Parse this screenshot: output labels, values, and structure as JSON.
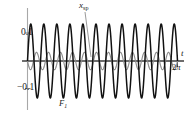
{
  "figure": {
    "labels": {
      "y_tick_positive": "0.1",
      "y_tick_negative": "−0.1",
      "curve_small_base": "x",
      "curve_small_sub": "sp",
      "curve_large_base": "F",
      "curve_large_sub": "1",
      "x_axis_name": "t",
      "x_tick_right_value": "2",
      "x_tick_right_unit": "π"
    },
    "colors": {
      "curve_large": "#111111",
      "curve_small": "#8a8a8a",
      "axis": "#9a9a9a",
      "x_axis": "#555555",
      "text": "#1a1a1a",
      "background": "#ffffff"
    }
  },
  "chart_data": {
    "type": "line",
    "title": "",
    "xlabel": "t",
    "ylabel": "",
    "xlim": [
      0,
      6.283185
    ],
    "ylim": [
      -0.155,
      0.155
    ],
    "grid": false,
    "legend": "inline-annotations",
    "x_ticks": [
      {
        "value": 6.283185,
        "label": "2π"
      }
    ],
    "y_ticks": [
      {
        "value": 0.1,
        "label": "0.1"
      },
      {
        "value": -0.1,
        "label": "−0.1"
      }
    ],
    "annotations": [
      {
        "text": "x_sp",
        "points_to_series": "x_sp",
        "x": 2.7,
        "y": 0.03
      },
      {
        "text": "F_1",
        "points_to_series": "F_1",
        "x": 1.35,
        "y": -0.13
      }
    ],
    "series": [
      {
        "name": "F_1",
        "label": "F₁",
        "kind": "sinusoid",
        "amplitude": 0.132,
        "cycles_over_domain": 11.5,
        "phase": 0.0,
        "color": "#111111",
        "linewidth": 1.5
      },
      {
        "name": "x_sp",
        "label": "x_sp",
        "kind": "sinusoid",
        "amplitude": 0.031,
        "cycles_over_domain": 12.5,
        "phase": 3.14159,
        "color": "#8a8a8a",
        "linewidth": 1.1
      }
    ]
  }
}
